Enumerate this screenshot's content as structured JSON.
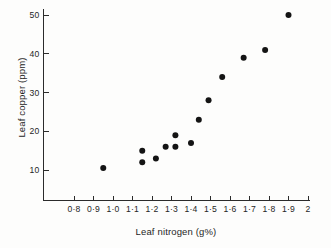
{
  "chart_data": {
    "type": "scatter",
    "title": "",
    "xlabel": "Leaf nitrogen (g%)",
    "ylabel": "Leaf copper (ppm)",
    "xlim": [
      0.75,
      2.0
    ],
    "ylim": [
      0,
      52
    ],
    "grid": false,
    "legend": null,
    "marker": {
      "shape": "circle",
      "filled": true,
      "color": "#141414",
      "size_px": 5
    },
    "xtick_labels": [
      "0·8",
      "0·9",
      "1·0",
      "1·1",
      "1·2",
      "1·3",
      "1·4",
      "1·5",
      "1·6",
      "1·7",
      "1·8",
      "1·9",
      "2"
    ],
    "xtick_values": [
      0.8,
      0.9,
      1.0,
      1.1,
      1.2,
      1.3,
      1.4,
      1.5,
      1.6,
      1.7,
      1.8,
      1.9,
      2.0
    ],
    "ytick_labels": [
      "10",
      "20",
      "30",
      "40",
      "50"
    ],
    "ytick_values": [
      10,
      20,
      30,
      40,
      50
    ],
    "x": [
      0.95,
      1.15,
      1.15,
      1.22,
      1.27,
      1.32,
      1.32,
      1.4,
      1.44,
      1.49,
      1.56,
      1.67,
      1.78,
      1.9
    ],
    "y": [
      10.5,
      12.0,
      15.0,
      13.0,
      16.0,
      16.0,
      19.0,
      17.0,
      23.0,
      28.0,
      34.0,
      39.0,
      41.0,
      50.0
    ],
    "points": [
      {
        "x": 0.95,
        "y": 10.5
      },
      {
        "x": 1.15,
        "y": 12.0
      },
      {
        "x": 1.15,
        "y": 15.0
      },
      {
        "x": 1.22,
        "y": 13.0
      },
      {
        "x": 1.27,
        "y": 16.0
      },
      {
        "x": 1.32,
        "y": 16.0
      },
      {
        "x": 1.32,
        "y": 19.0
      },
      {
        "x": 1.4,
        "y": 17.0
      },
      {
        "x": 1.44,
        "y": 23.0
      },
      {
        "x": 1.49,
        "y": 28.0
      },
      {
        "x": 1.56,
        "y": 34.0
      },
      {
        "x": 1.67,
        "y": 39.0
      },
      {
        "x": 1.78,
        "y": 41.0
      },
      {
        "x": 1.9,
        "y": 50.0
      }
    ]
  }
}
